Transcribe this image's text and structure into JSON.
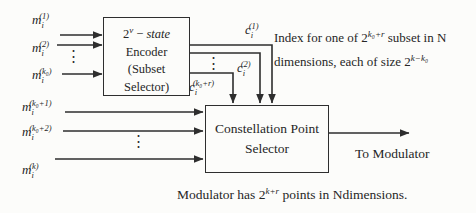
{
  "diagram": {
    "encoder_box": {
      "title_base": "2",
      "title_sup": "v",
      "title_sep": "−",
      "title_word": "state",
      "line2": "Encoder",
      "line3": "(Subset",
      "line4": "Selector)"
    },
    "constellation_box": {
      "line1": "Constellation Point",
      "line2": "Selector"
    },
    "inputs_upper": [
      {
        "base": "m",
        "sub": "i",
        "sup": "(1)"
      },
      {
        "base": "m",
        "sub": "i",
        "sup": "(2)"
      },
      {
        "base": "m",
        "sub": "i",
        "sup": "(k₀)"
      }
    ],
    "inputs_lower": [
      {
        "base": "m",
        "sub": "i",
        "sup": "(k₀+1)"
      },
      {
        "base": "m",
        "sub": "i",
        "sup": "(k₀+2)"
      },
      {
        "base": "m",
        "sub": "i",
        "sup": "(k)"
      }
    ],
    "outputs": [
      {
        "base": "c",
        "sub": "i",
        "sup": "(1)"
      },
      {
        "base": "c",
        "sub": "i",
        "sup": "(2)"
      },
      {
        "base": "c",
        "sub": "i",
        "sup": "(k₀+r)"
      }
    ],
    "dots": "⋮",
    "annotation_right": {
      "line1_pre": "Index for one of ",
      "line1_base": "2",
      "line1_sup": "k₀+r",
      "line1_post": " subset in N",
      "line2_pre": "dimensions, each of size ",
      "line2_base": "2",
      "line2_sup": "k−k₀"
    },
    "output_label": "To Modulator",
    "caption": {
      "pre": "Modulator has ",
      "base": "2",
      "sup": "k+r",
      "post": " points in Ndimensions."
    },
    "colors": {
      "ink": "#2e2e2e",
      "background": "#fcfcfa"
    }
  }
}
